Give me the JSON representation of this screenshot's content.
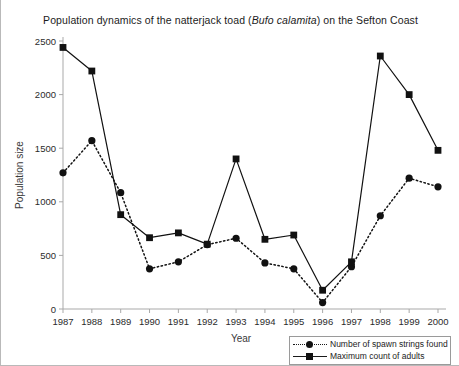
{
  "chart_data": {
    "type": "line",
    "title": "Population dynamics of the natterjack toad (Bufo calamita) on the Sefton Coast",
    "title_plain": "Population dynamics of the natterjack toad (",
    "title_species": "Bufo calamita",
    "title_tail": ") on the Sefton Coast",
    "xlabel": "Year",
    "ylabel": "Population size",
    "categories": [
      "1987",
      "1988",
      "1989",
      "1990",
      "1991",
      "1992",
      "1993",
      "1994",
      "1995",
      "1996",
      "1997",
      "1998",
      "1999",
      "2000"
    ],
    "x": [
      1987,
      1988,
      1989,
      1990,
      1991,
      1992,
      1993,
      1994,
      1995,
      1996,
      1997,
      1998,
      1999,
      2000
    ],
    "ylim": [
      0,
      2500
    ],
    "yticks": [
      0,
      500,
      1000,
      1500,
      2000,
      2500
    ],
    "ytick_labels": [
      "0",
      "500",
      "1000",
      "1500",
      "2000",
      "2500"
    ],
    "grid": false,
    "legend_position": "bottom-right",
    "series": [
      {
        "name": "Number of spawn strings found",
        "marker": "circle",
        "line_style": "dotted",
        "color": "#111111",
        "values": [
          1270,
          1570,
          1085,
          375,
          440,
          600,
          660,
          430,
          375,
          60,
          395,
          870,
          1220,
          1140
        ]
      },
      {
        "name": "Maximum count of adults",
        "marker": "square",
        "line_style": "solid",
        "color": "#111111",
        "values": [
          2440,
          2220,
          880,
          665,
          710,
          605,
          1400,
          650,
          690,
          175,
          440,
          2360,
          2000,
          1480
        ]
      }
    ]
  },
  "legend": {
    "items": [
      {
        "label": "Number of spawn strings found",
        "marker": "circle",
        "style": "dotted"
      },
      {
        "label": "Maximum count of adults",
        "marker": "square",
        "style": "solid"
      }
    ]
  }
}
